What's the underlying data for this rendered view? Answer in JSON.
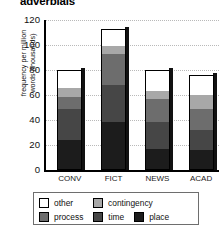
{
  "chart_data": {
    "type": "bar",
    "stacked": true,
    "title": "adverbials",
    "xlabel": "",
    "ylabel": "frequency per million words (thousands)",
    "ylabel_line1": "frequency per million",
    "ylabel_line2": "words (thousands)",
    "categories": [
      "CONV",
      "FICT",
      "NEWS",
      "ACAD"
    ],
    "ylim": [
      0,
      120
    ],
    "yticks": [
      0,
      20,
      40,
      60,
      80,
      100,
      120
    ],
    "ytick_labels": [
      "0",
      "20",
      "40",
      "60",
      "80",
      "100",
      "120"
    ],
    "grid": true,
    "legend_position": "bottom",
    "series": [
      {
        "name": "place",
        "color": "#1c1c1c",
        "values": [
          24,
          38,
          17,
          16
        ]
      },
      {
        "name": "time",
        "color": "#464646",
        "values": [
          25,
          30,
          22,
          16
        ]
      },
      {
        "name": "process",
        "color": "#6d6d6d",
        "values": [
          10,
          25,
          18,
          17
        ]
      },
      {
        "name": "contingency",
        "color": "#a8a8a8",
        "values": [
          7,
          7,
          7,
          12
        ]
      },
      {
        "name": "other",
        "color": "#ffffff",
        "values": [
          14,
          13,
          16,
          15
        ]
      }
    ],
    "totals": [
      80,
      113,
      80,
      76
    ]
  },
  "legend": {
    "row1": [
      {
        "label": "other",
        "color": "#ffffff"
      },
      {
        "label": "contingency",
        "color": "#a8a8a8"
      }
    ],
    "row2": [
      {
        "label": "process",
        "color": "#6d6d6d"
      },
      {
        "label": "time",
        "color": "#464646"
      },
      {
        "label": "place",
        "color": "#1c1c1c"
      }
    ]
  }
}
